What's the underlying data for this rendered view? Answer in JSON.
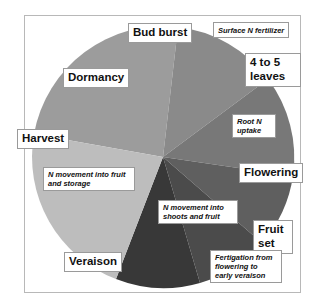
{
  "diagram": {
    "type": "pie-cycle",
    "stages": {
      "bud_burst": "Bud burst",
      "four_five_leaves_1": "4 to 5",
      "four_five_leaves_2": "leaves",
      "flowering": "Flowering",
      "fruit_set_1": "Fruit",
      "fruit_set_2": "set",
      "veraison": "Veraison",
      "harvest": "Harvest",
      "dormancy": "Dormancy"
    },
    "notes": {
      "surface_n": "Surface N fertilizer",
      "root_n_1": "Root N",
      "root_n_2": "uptake",
      "n_shoots_1": "N movement into",
      "n_shoots_2": "shoots and fruit",
      "fertigation_1": "Fertigation from",
      "fertigation_2": "flowering to",
      "fertigation_3": "early veraison",
      "n_fruit_storage_1": "N movement into fruit",
      "n_fruit_storage_2": "and storage"
    },
    "colors": {
      "dormancy_wedge": "#9c9c9c",
      "budburst_wedge": "#8c8c8c",
      "root_wedge": "#7a7a7a",
      "flowering_wedge": "#5e5e5e",
      "shoots_wedge": "#4a4a4a",
      "fruitset_wedge": "#3a3a3a",
      "storage_wedge": "#bdbdbd",
      "frame": "#b8b8b8"
    }
  }
}
